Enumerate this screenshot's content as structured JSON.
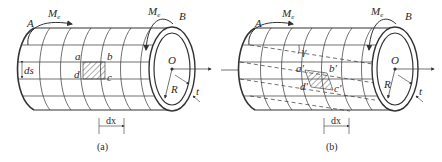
{
  "figure": {
    "panels": [
      {
        "id": "a",
        "caption": "(a)",
        "labels": {
          "end_A": "A",
          "end_B": "B",
          "moment_left": "M",
          "moment_left_sub": "e",
          "moment_right": "M",
          "moment_right_sub": "e",
          "corner_a": "a",
          "corner_b": "b",
          "corner_c": "c",
          "corner_d": "d",
          "ds": "ds",
          "dx": "dx",
          "center": "O",
          "radius": "R",
          "thickness": "t"
        },
        "state": "undeformed"
      },
      {
        "id": "b",
        "caption": "(b)",
        "labels": {
          "end_A": "A",
          "end_B": "B",
          "moment_left": "M",
          "moment_left_sub": "e",
          "moment_right": "M",
          "moment_right_sub": "e",
          "corner_a": "a'",
          "corner_b": "b'",
          "corner_c": "c'",
          "corner_d": "d'",
          "shear_angle": "γ",
          "dx": "dx",
          "center": "O",
          "radius": "R",
          "thickness": "t"
        },
        "state": "deformed (sheared)"
      }
    ],
    "colors": {
      "line": "#333333",
      "text": "#2a2a2a",
      "background": "#ffffff"
    }
  }
}
